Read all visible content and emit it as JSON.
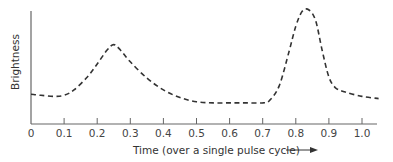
{
  "chart_data": {
    "type": "line",
    "title": "",
    "xlabel": "Time (over a single pulse cycle)",
    "ylabel": "Brightness",
    "xlim": [
      0,
      1.05
    ],
    "ylim": [
      0,
      1
    ],
    "grid": false,
    "legend": null,
    "x_ticks": [
      "0",
      "0.1",
      "0.2",
      "0.3",
      "0.4",
      "0.5",
      "0.6",
      "0.7",
      "0.8",
      "0.9",
      "1.0"
    ],
    "series": [
      {
        "name": "Brightness",
        "style": "dashed",
        "color": "#333333",
        "x": [
          0,
          0.03,
          0.07,
          0.1,
          0.13,
          0.17,
          0.2,
          0.23,
          0.25,
          0.27,
          0.3,
          0.35,
          0.4,
          0.45,
          0.5,
          0.55,
          0.6,
          0.65,
          0.7,
          0.72,
          0.75,
          0.78,
          0.8,
          0.82,
          0.84,
          0.86,
          0.88,
          0.9,
          0.92,
          0.95,
          1.0,
          1.05
        ],
        "values": [
          0.22,
          0.21,
          0.2,
          0.21,
          0.26,
          0.38,
          0.5,
          0.63,
          0.68,
          0.63,
          0.52,
          0.37,
          0.26,
          0.19,
          0.15,
          0.14,
          0.14,
          0.14,
          0.14,
          0.16,
          0.3,
          0.62,
          0.85,
          0.99,
          1.0,
          0.9,
          0.62,
          0.38,
          0.28,
          0.24,
          0.2,
          0.18
        ]
      }
    ]
  }
}
